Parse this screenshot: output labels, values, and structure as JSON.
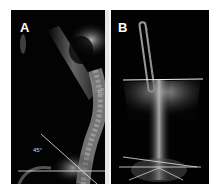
{
  "figure": {
    "panels": [
      {
        "label": "A",
        "angle_annotation": "45°",
        "marker_text": "CR\nRO"
      },
      {
        "label": "B"
      }
    ],
    "colors": {
      "background": "#000000",
      "frame": "#ffffff",
      "measurement_lines": "#e8e8e8",
      "bone": "#bdbdbd"
    }
  }
}
